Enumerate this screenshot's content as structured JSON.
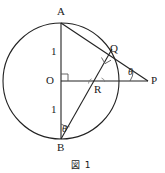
{
  "figure": {
    "caption": "図 1",
    "points": {
      "A": {
        "label": "A",
        "x": 61,
        "y": 23
      },
      "B": {
        "label": "B",
        "x": 61,
        "y": 139
      },
      "O": {
        "label": "O",
        "x": 61,
        "y": 81
      },
      "P": {
        "label": "P",
        "x": 148,
        "y": 81
      },
      "Q": {
        "label": "Q",
        "x": 107,
        "y": 56
      },
      "R": {
        "label": "R",
        "x": 95,
        "y": 81
      }
    },
    "circle": {
      "cx": 61,
      "cy": 81,
      "r": 58
    },
    "segment_lengths": {
      "OA": "1",
      "OB": "1"
    },
    "angles": {
      "at_P": "θ",
      "at_B": "θ",
      "right_angle_at_O": "90°",
      "right_angle_at_Q": "90°"
    },
    "colors": {
      "stroke": "#222222",
      "text": "#1a1a1a",
      "background": "#ffffff"
    }
  }
}
